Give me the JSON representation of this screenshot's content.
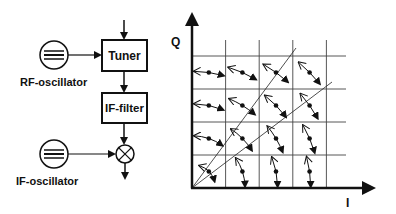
{
  "block_diagram": {
    "tuner_label": "Tuner",
    "if_filter_label": "IF-filter",
    "rf_oscillator_label": "RF-oscillator",
    "if_oscillator_label": "IF-oscillator",
    "mixer_symbol": "⊗"
  },
  "iq_plot": {
    "y_axis_label": "Q",
    "x_axis_label": "I",
    "grid_cells": 4,
    "colors": {
      "ink": "#111111",
      "grid": "#444444",
      "background": "#ffffff"
    }
  }
}
